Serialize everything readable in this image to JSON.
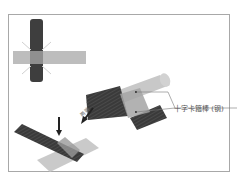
{
  "figure": {
    "callout_label": "十字卡箍棒 (钢)",
    "arrow_label": "两端",
    "colors": {
      "dark_bar": "#3c3c3c",
      "light_bar": "#c4c4c4",
      "frame": "#a8a8a8",
      "sparkle": "#cfcfcf"
    },
    "components": [
      "cross-joint-detail",
      "assembled-t-bar",
      "assembly-arrow",
      "crossed-bars-bottom",
      "down-arrow"
    ]
  }
}
